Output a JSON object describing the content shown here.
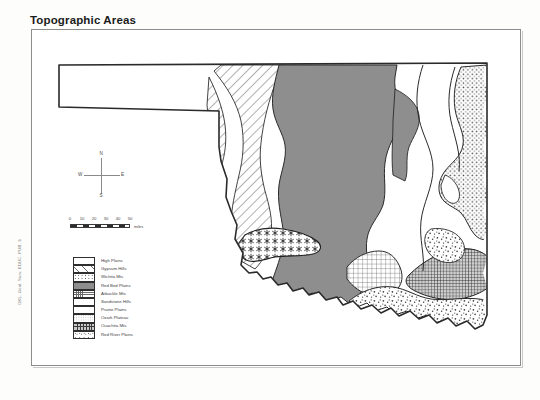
{
  "title": "Topographic Areas",
  "spine_text": "OKL.  Geol. Surv.  EDUC. PUB.  3",
  "compass": {
    "north": "N",
    "south": "S",
    "east": "E",
    "west": "W"
  },
  "scale": {
    "ticks": [
      "0",
      "10",
      "20",
      "30",
      "40",
      "50"
    ],
    "unit": "miles"
  },
  "legend": {
    "items": [
      {
        "label": "High Plains",
        "pattern": "plain",
        "color": "#ffffff"
      },
      {
        "label": "Gypsum Hills",
        "pattern": "hatch",
        "color": "#6e6e6e"
      },
      {
        "label": "Wichita Mts",
        "pattern": "star",
        "color": "#2a2a2a"
      },
      {
        "label": "Red Bed Plains",
        "pattern": "solid",
        "color": "#8e8e8e"
      },
      {
        "label": "Arbuckle Mts",
        "pattern": "grid",
        "color": "#6a6a6a"
      },
      {
        "label": "Sandstone Hills",
        "pattern": "sandstone",
        "color": "#ffffff"
      },
      {
        "label": "Prairie Plains",
        "pattern": "prairie",
        "color": "#ffffff"
      },
      {
        "label": "Ozark Plateau",
        "pattern": "dot",
        "color": "#4f4f4f"
      },
      {
        "label": "Ouachita Mts",
        "pattern": "dense",
        "color": "#3a3a3a"
      },
      {
        "label": "Red River Plains",
        "pattern": "stipple",
        "color": "#444444"
      }
    ]
  },
  "map": {
    "name": "Oklahoma topographic areas map",
    "regions": [
      "High Plains",
      "Gypsum Hills",
      "Wichita Mts",
      "Red Bed Plains",
      "Arbuckle Mts",
      "Sandstone Hills",
      "Prairie Plains",
      "Ozark Plateau",
      "Ouachita Mts",
      "Red River Plains"
    ]
  }
}
